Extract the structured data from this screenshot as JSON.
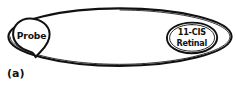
{
  "figure": {
    "panel_label": "(a)",
    "background_color": "#ffffff",
    "ink_color": "#111111",
    "width_px": 236,
    "height_px": 89,
    "outer_shape": {
      "name": "membrane-ellipse",
      "shape": "ellipse",
      "center_x": 120,
      "center_y": 37,
      "radius_x": 112,
      "radius_y": 29
    },
    "probe_marker": {
      "label": "Probe",
      "shape": "teardrop",
      "center_x": 31,
      "center_y": 36
    },
    "retinal_marker": {
      "label_line_1": "11-CIS",
      "label_line_2": "Retinal",
      "shape": "ellipse",
      "center_x": 192,
      "center_y": 38,
      "radius_x": 25,
      "radius_y": 15
    }
  }
}
